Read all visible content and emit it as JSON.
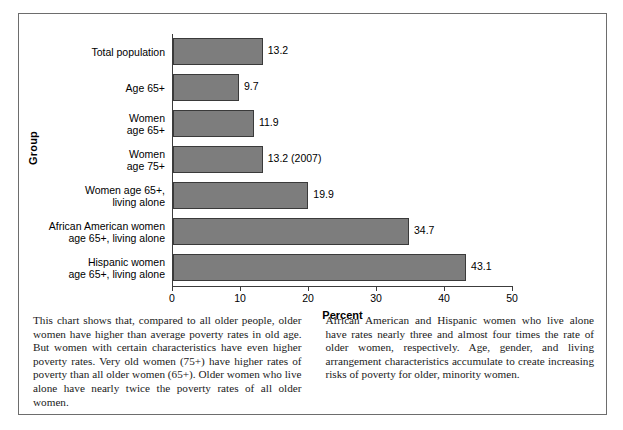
{
  "figure": {
    "y_axis_title": "Group",
    "x_axis_title": "Percent"
  },
  "chart_data": {
    "type": "bar",
    "orientation": "horizontal",
    "title": "",
    "xlabel": "Percent",
    "ylabel": "Group",
    "xlim": [
      0,
      50
    ],
    "xticks": [
      0,
      10,
      20,
      30,
      40,
      50
    ],
    "xtick_labels": [
      "0",
      "10",
      "20",
      "30",
      "40",
      "50"
    ],
    "grid": false,
    "legend": null,
    "bar_color": "#7d7d7d",
    "bar_edge_color": "#3a3a3a",
    "categories": [
      "Total population",
      "Age 65+",
      "Women\nage 65+",
      "Women\nage 75+",
      "Women age 65+,\nliving alone",
      "African American women\nage 65+, living alone",
      "Hispanic women\nage 65+, living alone"
    ],
    "values": [
      13.2,
      9.7,
      11.9,
      13.2,
      19.9,
      34.7,
      43.1
    ],
    "value_labels": [
      "13.2",
      "9.7",
      "11.9",
      "13.2 (2007)",
      "19.9",
      "34.7",
      "43.1"
    ]
  },
  "caption": {
    "left": "This chart shows that, compared to all older people, older women have higher than average poverty rates in old age. But women with certain characteristics have even higher poverty rates. Very old women (75+) have higher rates of poverty than all older women (65+). Older women who live alone have nearly twice the poverty rates of all older women.",
    "right": "African American and Hispanic women who live alone have rates nearly three and almost four times the rate of older women, respectively. Age, gender, and living arrangement characteristics accumulate to create increasing risks of poverty for older, minority women."
  }
}
